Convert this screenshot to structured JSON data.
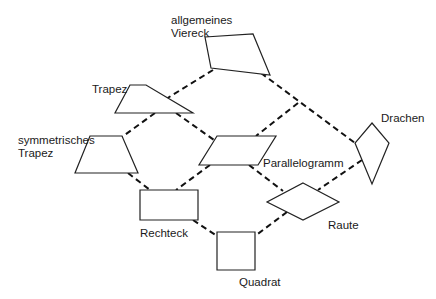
{
  "nodes": {
    "viereck": {
      "label": "allgemeines\nViereck",
      "points": "205,37 253,34 270,75 211,68",
      "label_x": 171,
      "label_y": 14
    },
    "trapez": {
      "label": "Trapez",
      "points": "130,85 146,85 193,113 115,113",
      "label_x": 92,
      "label_y": 83
    },
    "sym_trapez": {
      "label": "symmetrisches\nTrapez",
      "points": "90,136 122,136 138,173 75,173",
      "label_x": 18,
      "label_y": 134
    },
    "parallelogramm": {
      "label": "Parallelogramm",
      "points": "217,136 276,136 258,165 199,165",
      "label_x": 263,
      "label_y": 157
    },
    "drachen": {
      "label": "Drachen",
      "points": "372,123 389,143 372,184 355,143",
      "label_x": 381,
      "label_y": 112
    },
    "rechteck": {
      "label": "Rechteck",
      "points": "140,190 198,190 198,220 140,220",
      "label_x": 140,
      "label_y": 227
    },
    "raute": {
      "label": "Raute",
      "points": "303,183 339,202 303,220 267,202",
      "label_x": 328,
      "label_y": 219
    },
    "quadrat": {
      "label": "Quadrat",
      "points": "217,232 255,232 255,270 217,270",
      "label_x": 239,
      "label_y": 276
    }
  },
  "edges": [
    {
      "from": "viereck",
      "to": "trapez",
      "x1": 213,
      "y1": 70,
      "x2": 166,
      "y2": 99
    },
    {
      "from": "viereck",
      "to": "drachen",
      "x1": 261,
      "y1": 73,
      "x2": 355,
      "y2": 143
    },
    {
      "from": "trapez",
      "to": "sym_trapez",
      "x1": 155,
      "y1": 113,
      "x2": 122,
      "y2": 137
    },
    {
      "from": "trapez",
      "to": "parallelogramm",
      "x1": 176,
      "y1": 113,
      "x2": 214,
      "y2": 140
    },
    {
      "from": "drachen",
      "to": "raute",
      "x1": 362,
      "y1": 160,
      "x2": 318,
      "y2": 190
    },
    {
      "from": "parallelogramm",
      "to": "rechteck",
      "x1": 210,
      "y1": 165,
      "x2": 176,
      "y2": 190
    },
    {
      "from": "parallelogramm",
      "to": "raute",
      "x1": 249,
      "y1": 165,
      "x2": 283,
      "y2": 191
    },
    {
      "from": "viereck_drachen_mid",
      "to": "parallelogramm",
      "x1": 298,
      "y1": 103,
      "x2": 256,
      "y2": 136
    },
    {
      "from": "sym_trapez",
      "to": "rechteck",
      "x1": 128,
      "y1": 173,
      "x2": 150,
      "y2": 190
    },
    {
      "from": "rechteck",
      "to": "quadrat",
      "x1": 193,
      "y1": 220,
      "x2": 217,
      "y2": 236
    },
    {
      "from": "raute",
      "to": "quadrat",
      "x1": 287,
      "y1": 212,
      "x2": 255,
      "y2": 236
    }
  ]
}
